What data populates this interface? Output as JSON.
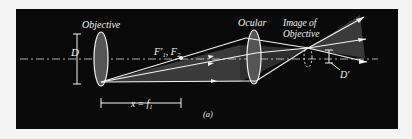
{
  "figure": {
    "panel_label": "(a)",
    "labels": {
      "objective": "Objective",
      "ocular": "Ocular",
      "image_of_objective_line1": "Image of",
      "image_of_objective_line2": "Objective",
      "aperture_D": "D",
      "aperture_D_prime": "D′",
      "focal_points": "F′₁, F₂",
      "distance": "x = f₁"
    },
    "colors": {
      "background": "#0a0a0a",
      "lines": "#f2f2f2",
      "cone_fill": "#3a3a3a",
      "page": "#f4f4f4"
    }
  }
}
